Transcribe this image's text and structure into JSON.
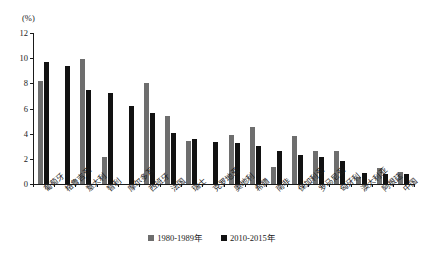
{
  "chart_data": {
    "type": "bar",
    "title": "",
    "xlabel": "",
    "ylabel": "(%)",
    "yunit": "(%)",
    "ylim": [
      0,
      12
    ],
    "yticks": [
      0,
      2,
      4,
      6,
      8,
      10,
      12
    ],
    "ytick_labels": [
      "0",
      "2",
      "4",
      "6",
      "8",
      "10",
      "12"
    ],
    "grid": false,
    "legend_position": "bottom-center",
    "categories": [
      "葡萄牙",
      "格鲁吉亚",
      "意大利",
      "智利",
      "摩尔多瓦",
      "西班牙",
      "法国",
      "瑞士",
      "克罗地亚",
      "奥地利",
      "希腊",
      "南非",
      "保加利亚",
      "罗马尼亚",
      "匈牙利",
      "澳大利亚",
      "阿根廷",
      "中国"
    ],
    "series": [
      {
        "name": "1980-1989年",
        "color": "#6e6e6e",
        "values": [
          8.2,
          null,
          9.9,
          2.15,
          null,
          8.0,
          5.4,
          3.45,
          null,
          3.9,
          4.55,
          1.35,
          3.8,
          2.65,
          2.65,
          0.55,
          1.3,
          0.95
        ]
      },
      {
        "name": "2010-2015年",
        "color": "#121212",
        "values": [
          9.7,
          9.4,
          7.5,
          7.2,
          6.2,
          5.65,
          4.05,
          3.6,
          3.3,
          3.25,
          3.0,
          2.65,
          2.3,
          2.15,
          1.85,
          0.9,
          0.8,
          0.8
        ]
      }
    ],
    "legend": [
      {
        "label": "1980-1989年",
        "color": "#6e6e6e"
      },
      {
        "label": "2010-2015年",
        "color": "#121212"
      }
    ]
  }
}
